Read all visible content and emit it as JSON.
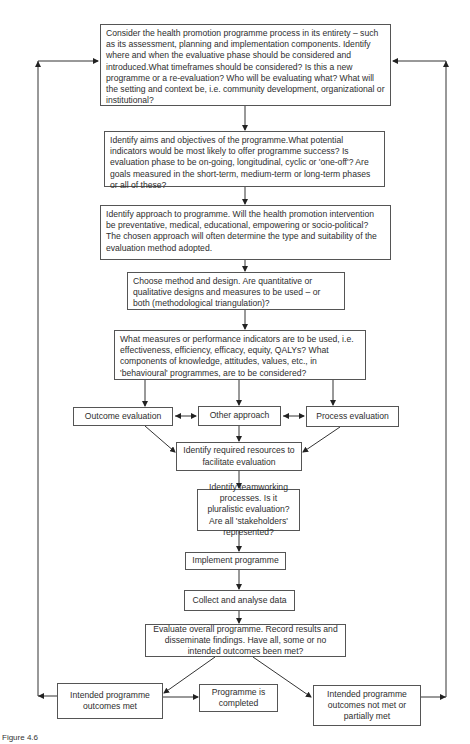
{
  "diagram": {
    "steps": {
      "consider": "Consider the health promotion programme process in its entirety – such as its assessment, planning and implementation components. Identify where and when the evaluative phase should be considered and introduced.What timeframes should be considered? Is this a new programme or a re-evaluation? Who will be evaluating what? What will the setting and context be, i.e. community development, organizational or institutional?",
      "aims": "Identify aims and objectives of the programme.What potential indicators would be most likely to offer programme success? Is evaluation phase to be on-going, longitudinal, cyclic or 'one-off'? Are goals measured in the short-term, medium-term or long-term phases or all of these?",
      "approach": "Identify approach to programme. Will the health promotion intervention be preventative, medical, educational, empowering or socio-political? The chosen approach will often determine the type and suitability of the evaluation method adopted.",
      "method": "Choose method and design. Are quantitative or qualitative designs and measures to be used – or both (methodological triangulation)?",
      "measures": "What measures or performance indicators are to be used, i.e. effectiveness, efficiency, efficacy, equity, QALYs? What components of knowledge, attitudes, values, etc., in 'behavioural' programmes, are to be considered?",
      "outcome_eval": "Outcome evaluation",
      "other_approach": "Other approach",
      "process_eval": "Process evaluation",
      "resources": "Identify required resources to facilitate evaluation",
      "teamwork": "Identify teamworking processes. Is it pluralistic evaluation? Are all 'stakeholders' represented?",
      "implement": "Implement programme",
      "collect": "Collect and analyse data",
      "evaluate": "Evaluate overall programme. Record results and disseminate findings. Have all, some or no intended outcomes been met?",
      "outcomes_met": "Intended programme outcomes met",
      "completed": "Programme is completed",
      "outcomes_not_met": "Intended programme outcomes not met or partially met"
    },
    "caption": "Figure 4.6"
  }
}
